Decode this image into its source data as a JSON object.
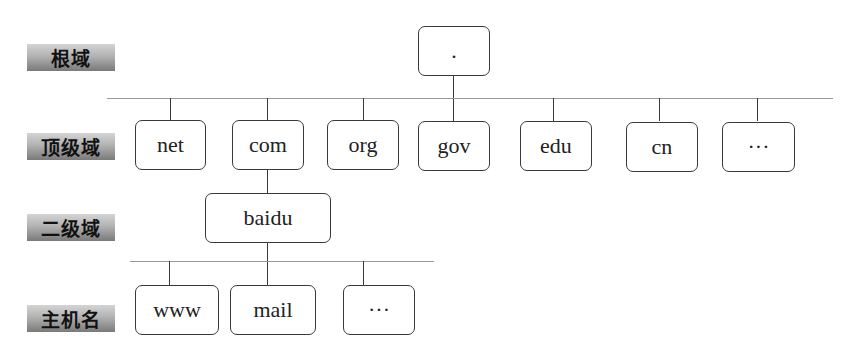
{
  "levels": {
    "root": "根域",
    "tld": "顶级域",
    "second": "二级域",
    "host": "主机名"
  },
  "nodes": {
    "root": ".",
    "tld": [
      "net",
      "com",
      "org",
      "gov",
      "edu",
      "cn",
      "···"
    ],
    "second": "baidu",
    "host": [
      "www",
      "mail",
      "···"
    ]
  },
  "colors": {
    "border": "#3a3a3a",
    "bus_line": "#9a9a9a",
    "label_gradient_top": "#d4d4d4",
    "label_gradient_bottom": "#7a7a7a"
  }
}
